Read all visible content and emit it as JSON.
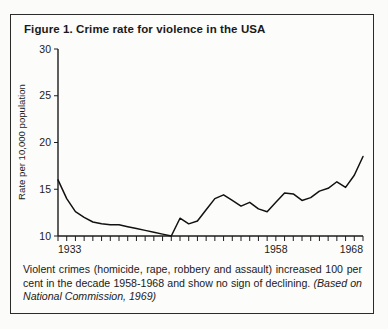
{
  "figure": {
    "title": "Figure 1. Crime rate for violence in the USA",
    "caption_main": "Violent crimes (homicide, rape, robbery and assault) increased 100 per cent in the decade 1958-1968 and show no sign of declining.",
    "caption_source": "(Based on National Commission, 1969)"
  },
  "chart_data": {
    "type": "line",
    "title": "Figure 1. Crime rate for violence in the USA",
    "xlabel": "",
    "ylabel": "Rate per 10,000 population",
    "xlim": [
      1933,
      1968
    ],
    "ylim": [
      10,
      30
    ],
    "yticks": [
      10,
      15,
      20,
      25,
      30
    ],
    "ytick_labels": [
      "10",
      "15",
      "20",
      "25",
      "30"
    ],
    "xticks": [
      1933,
      1958,
      1968
    ],
    "xtick_labels": [
      "1933",
      "1958",
      "1968"
    ],
    "xminor_tick_interval": 1,
    "grid": false,
    "legend": null,
    "series": [
      {
        "name": "Crime rate for violence",
        "x": [
          1933,
          1934,
          1935,
          1936,
          1937,
          1938,
          1939,
          1940,
          1941,
          1942,
          1943,
          1944,
          1945,
          1946,
          1947,
          1948,
          1949,
          1950,
          1951,
          1952,
          1953,
          1954,
          1955,
          1956,
          1957,
          1958,
          1959,
          1960,
          1961,
          1962,
          1963,
          1964,
          1965,
          1966,
          1967,
          1968
        ],
        "values": [
          16.0,
          14.0,
          12.6,
          12.0,
          11.5,
          11.3,
          11.2,
          11.2,
          11.0,
          10.8,
          10.6,
          10.4,
          10.2,
          10.0,
          11.9,
          11.3,
          11.6,
          12.8,
          14.0,
          14.4,
          13.8,
          13.2,
          13.6,
          12.9,
          12.6,
          13.6,
          14.6,
          14.5,
          13.8,
          14.1,
          14.8,
          15.1,
          15.8,
          15.2,
          16.5,
          18.5
        ]
      }
    ]
  }
}
